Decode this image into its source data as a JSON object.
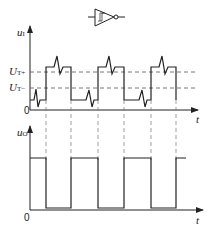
{
  "gate": {
    "type": "schmitt-trigger-inverter",
    "symbol": "hysteresis"
  },
  "input_chart": {
    "y_label": "u",
    "y_label_sub": "I",
    "x_label": "t",
    "origin": "0",
    "thresholds": [
      {
        "label": "U",
        "sub": "T+"
      },
      {
        "label": "U",
        "sub": "T−"
      }
    ]
  },
  "output_chart": {
    "y_label": "u",
    "y_label_sub": "O",
    "x_label": "t",
    "origin": "0"
  },
  "colors": {
    "line": "#222222",
    "dash": "#555555"
  }
}
